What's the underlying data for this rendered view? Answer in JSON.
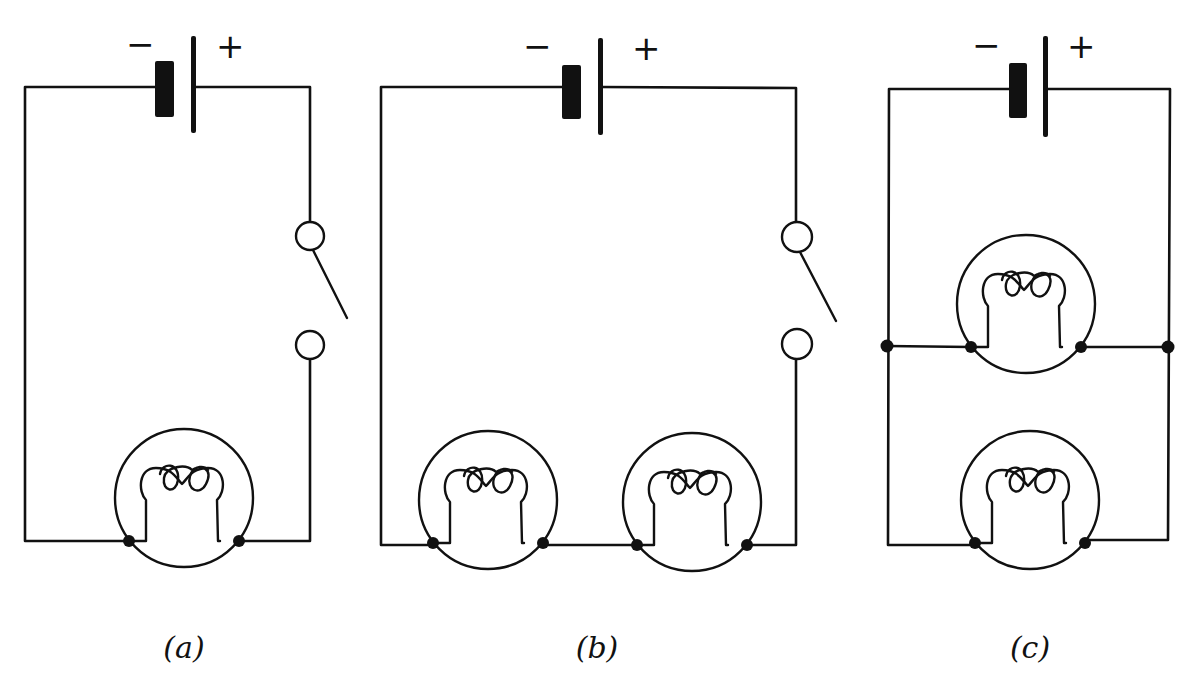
{
  "figure": {
    "line_color": "#111111",
    "background": "#ffffff"
  },
  "circuits": [
    {
      "id": "a",
      "caption": "(a)",
      "battery": {
        "negative_label": "−",
        "positive_label": "+"
      },
      "switch": {
        "state": "open"
      },
      "bulbs": 1,
      "configuration": "single bulb with switch"
    },
    {
      "id": "b",
      "caption": "(b)",
      "battery": {
        "negative_label": "−",
        "positive_label": "+"
      },
      "switch": {
        "state": "open"
      },
      "bulbs": 2,
      "configuration": "two bulbs in series with switch"
    },
    {
      "id": "c",
      "caption": "(c)",
      "battery": {
        "negative_label": "−",
        "positive_label": "+"
      },
      "switch": null,
      "bulbs": 2,
      "configuration": "two bulbs in parallel"
    }
  ]
}
